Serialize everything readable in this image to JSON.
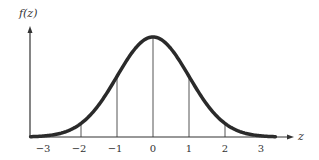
{
  "chart_data": {
    "type": "line",
    "title": "",
    "xlabel": "z",
    "ylabel": "f(z)",
    "x_ticks": [
      "-3",
      "-2",
      "-1",
      "0",
      "1",
      "2",
      "3"
    ],
    "xlim": [
      -3.4,
      3.4
    ],
    "series": [
      {
        "name": "f(z)",
        "x": [
          -3.4,
          -3,
          -2,
          -1,
          0,
          1,
          2,
          3,
          3.4
        ],
        "values": [
          0.0012,
          0.0044,
          0.054,
          0.242,
          0.3989,
          0.242,
          0.054,
          0.0044,
          0.0012
        ]
      }
    ],
    "vertical_lines_at": [
      -2,
      -1,
      0,
      1,
      2
    ],
    "grid": false,
    "legend": "none"
  },
  "axes": {
    "y_label": "f(z)",
    "x_label": "z"
  },
  "colors": {
    "curve": "#2a2a2a",
    "axis": "#333333",
    "lines": "#555555"
  }
}
